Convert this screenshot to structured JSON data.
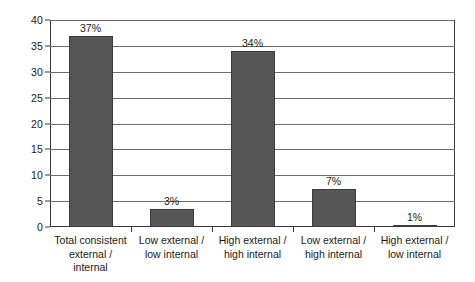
{
  "chart_data": {
    "type": "bar",
    "title": "",
    "subtitle": "",
    "xlabel": "",
    "ylabel": "",
    "ylim": [
      0,
      40
    ],
    "ytick_step": 5,
    "yticks": [
      "40",
      "35",
      "30",
      "25",
      "20",
      "15",
      "10",
      "5",
      "0"
    ],
    "ytick_values": [
      40,
      35,
      30,
      25,
      20,
      15,
      10,
      5,
      0
    ],
    "grid": true,
    "grid_axis": "y",
    "legend": false,
    "legend_position": "none",
    "categories": [
      "Total consistent external / internal",
      "Low external / low internal",
      "High external / high internal",
      "Low external / high internal",
      "High external / low internal"
    ],
    "category_lines": [
      [
        "Total consistent",
        "external /",
        "internal"
      ],
      [
        "Low external /",
        "low internal"
      ],
      [
        "High external /",
        "high internal"
      ],
      [
        "Low external /",
        "high internal"
      ],
      [
        "High external /",
        "low internal"
      ]
    ],
    "values": [
      37,
      3.5,
      34,
      7.4,
      0.4
    ],
    "data_labels": [
      "37%",
      "3%",
      "34%",
      "7%",
      "1%"
    ],
    "bar_color": "#565656",
    "bar_border_color": "#3b3b3b",
    "grid_color": "#6e6e6e",
    "axis_color": "#3a3a3a",
    "background_color": "#ffffff",
    "text_color": "#1a1a1a"
  }
}
